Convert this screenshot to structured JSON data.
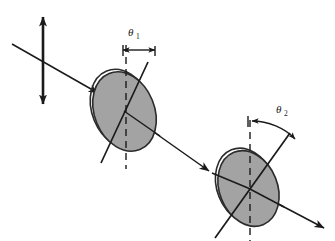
{
  "figure": {
    "background_color": "#ffffff",
    "stroke_color": "#1a1a1a",
    "polarizer_fill_color": "#a3a3a3",
    "polarizer_edge_color": "#2b2b2b",
    "width": 335,
    "height": 241
  },
  "labels": {
    "theta1": {
      "symbol": "θ",
      "subscript": "1",
      "x": 128,
      "y": 36
    },
    "theta2": {
      "symbol": "θ",
      "subscript": "2",
      "x": 276,
      "y": 113
    }
  },
  "elements": {
    "polarization_arrow": {
      "name": "vertical double-headed polarization arrow",
      "x": 43,
      "y_top": 15,
      "y_bottom": 106
    },
    "incident_beam": {
      "name": "incident light ray",
      "x1": 12,
      "y1": 44,
      "x2": 98,
      "y2": 93
    },
    "middle_beam": {
      "name": "ray between polarizers",
      "x1": 124,
      "y1": 111,
      "x2": 208,
      "y2": 170
    },
    "exit_beam": {
      "name": "transmitted ray",
      "x1": 248,
      "y1": 188,
      "x2": 323,
      "y2": 227
    },
    "polarizer_1": {
      "name": "first polarizer disc",
      "cx": 124,
      "cy": 111,
      "rx": 30,
      "ry": 41,
      "rotation_deg": -22,
      "axis_tilt_deg": 25
    },
    "polarizer_2": {
      "name": "second polarizer disc",
      "cx": 248,
      "cy": 188,
      "rx": 29,
      "ry": 39,
      "rotation_deg": -22,
      "axis_tilt_deg": 43
    },
    "reference_line_1": {
      "name": "vertical dashed reference line at polarizer 1",
      "x": 126,
      "y_top": 45,
      "y_bottom": 168
    },
    "reference_line_2": {
      "name": "vertical dashed reference line at polarizer 2",
      "x": 250,
      "y_top": 120,
      "y_bottom": 240
    },
    "angle_arc_1": {
      "name": "theta-1 angle indicator arrow"
    },
    "angle_arc_2": {
      "name": "theta-2 angle indicator arrow"
    }
  }
}
